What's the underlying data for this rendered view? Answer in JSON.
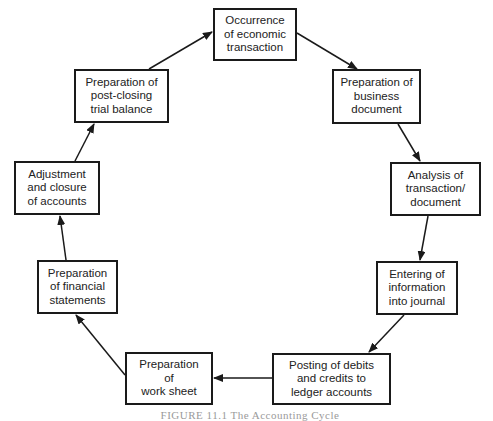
{
  "diagram": {
    "type": "cycle",
    "direction": "clockwise",
    "nodes": [
      {
        "id": "n1",
        "label": "Occurrence\nof economic\ntransaction",
        "x": 213,
        "y": 8,
        "w": 84,
        "h": 53
      },
      {
        "id": "n2",
        "label": "Preparation of\nbusiness\ndocument",
        "x": 332,
        "y": 69,
        "w": 89,
        "h": 55
      },
      {
        "id": "n3",
        "label": "Analysis of\ntransaction/\ndocument",
        "x": 390,
        "y": 162,
        "w": 91,
        "h": 54
      },
      {
        "id": "n4",
        "label": "Entering of\ninformation\ninto journal",
        "x": 376,
        "y": 261,
        "w": 82,
        "h": 54
      },
      {
        "id": "n5",
        "label": "Posting of debits\nand credits to\nledger accounts",
        "x": 272,
        "y": 353,
        "w": 119,
        "h": 52
      },
      {
        "id": "n6",
        "label": "Preparation\nof\nwork sheet",
        "x": 125,
        "y": 352,
        "w": 88,
        "h": 53
      },
      {
        "id": "n7",
        "label": "Preparation\nof financial\nstatements",
        "x": 37,
        "y": 260,
        "w": 81,
        "h": 54
      },
      {
        "id": "n8",
        "label": "Adjustment\nand closure\nof accounts",
        "x": 14,
        "y": 161,
        "w": 86,
        "h": 54
      },
      {
        "id": "n9",
        "label": "Preparation of\npost-closing\ntrial balance",
        "x": 74,
        "y": 69,
        "w": 95,
        "h": 54
      }
    ],
    "edges": [
      {
        "from": "n1",
        "to": "n2"
      },
      {
        "from": "n2",
        "to": "n3"
      },
      {
        "from": "n3",
        "to": "n4"
      },
      {
        "from": "n4",
        "to": "n5"
      },
      {
        "from": "n5",
        "to": "n6"
      },
      {
        "from": "n6",
        "to": "n7"
      },
      {
        "from": "n7",
        "to": "n8"
      },
      {
        "from": "n8",
        "to": "n9"
      },
      {
        "from": "n9",
        "to": "n1"
      }
    ],
    "caption": "FIGURE 11.1 The Accounting Cycle",
    "colors": {
      "stroke": "#1a1a1a",
      "text": "#222222",
      "background": "#ffffff"
    }
  }
}
